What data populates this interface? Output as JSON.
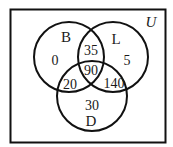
{
  "diagram": {
    "type": "venn-3",
    "universe_label": "U",
    "colors": {
      "stroke": "#111111",
      "background": "#ffffff",
      "text": "#1a1a1a"
    },
    "sets": [
      {
        "id": "B",
        "label": "B"
      },
      {
        "id": "L",
        "label": "L"
      },
      {
        "id": "D",
        "label": "D"
      }
    ],
    "regions": {
      "B_only": "0",
      "L_only": "5",
      "D_only": "30",
      "B_and_L_only": "35",
      "B_and_D_only": "20",
      "L_and_D_only": "140",
      "B_and_L_and_D": "90"
    }
  }
}
